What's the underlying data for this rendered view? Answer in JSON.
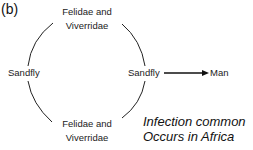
{
  "panel_label": "(b)",
  "nodes": {
    "top_host": {
      "line1": "Felidae and",
      "line2": "Viverridae"
    },
    "left_vector": {
      "label": "Sandfly"
    },
    "right_vector": {
      "label": "Sandfly"
    },
    "bottom_host": {
      "line1": "Felidae and",
      "line2": "Viverridae"
    },
    "human": {
      "label": "Man"
    }
  },
  "note": {
    "line1": "Infection common",
    "line2": "Occurs in Africa"
  },
  "edges": [
    {
      "from": "top_host",
      "to": "left_vector",
      "type": "arc"
    },
    {
      "from": "top_host",
      "to": "right_vector",
      "type": "arc"
    },
    {
      "from": "left_vector",
      "to": "bottom_host",
      "type": "arc"
    },
    {
      "from": "right_vector",
      "to": "bottom_host",
      "type": "arc"
    },
    {
      "from": "right_vector",
      "to": "human",
      "type": "arrow"
    }
  ]
}
